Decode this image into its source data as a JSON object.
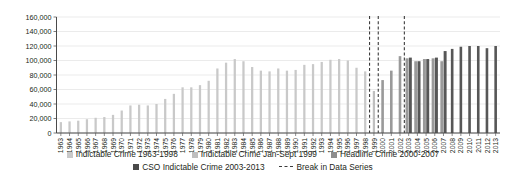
{
  "chart_data": {
    "type": "bar",
    "title": "",
    "subtitle": "",
    "xlabel": "",
    "ylabel": "",
    "ylim": [
      0,
      160000
    ],
    "ytick_step": 20000,
    "ytick_labels": [
      "0",
      "20,000",
      "40,000",
      "60,000",
      "80,000",
      "100,000",
      "120,000",
      "140,000",
      "160,000"
    ],
    "grid": true,
    "legend_position": "bottom",
    "categories": [
      "1963",
      "1964",
      "1965",
      "1966",
      "1967",
      "1968",
      "1969",
      "1970",
      "1971",
      "1972",
      "1973",
      "1974",
      "1975",
      "1976",
      "1977",
      "1978",
      "1979",
      "1980",
      "1981",
      "1982",
      "1983",
      "1984",
      "1985",
      "1986",
      "1987",
      "1988",
      "1989",
      "1990",
      "1991",
      "1992",
      "1993",
      "1994",
      "1995",
      "1996",
      "1997",
      "1998",
      "1999",
      "2000",
      "2001",
      "2002",
      "2003",
      "2004",
      "2005",
      "2006",
      "2007",
      "2008",
      "2009",
      "2010",
      "2011",
      "2012",
      "2013"
    ],
    "series": [
      {
        "name": "Indictable Crime 1963-1998",
        "color": "#c9c9c9",
        "values": [
          15000,
          16000,
          17000,
          19000,
          21000,
          22000,
          25000,
          31000,
          38000,
          39000,
          38000,
          40000,
          47000,
          54000,
          63000,
          63000,
          66000,
          72000,
          89000,
          97000,
          102000,
          99000,
          91000,
          86000,
          85000,
          89000,
          86000,
          87000,
          94000,
          95000,
          98000,
          101000,
          102000,
          100000,
          90000,
          85000,
          null,
          null,
          null,
          null,
          null,
          null,
          null,
          null,
          null,
          null,
          null,
          null,
          null,
          null,
          null
        ]
      },
      {
        "name": "Indictable Crime Jan-Sept 1999",
        "color": "#bfbfbf",
        "values": [
          null,
          null,
          null,
          null,
          null,
          null,
          null,
          null,
          null,
          null,
          null,
          null,
          null,
          null,
          null,
          null,
          null,
          null,
          null,
          null,
          null,
          null,
          null,
          null,
          null,
          null,
          null,
          null,
          null,
          null,
          null,
          null,
          null,
          null,
          null,
          null,
          58000,
          null,
          null,
          null,
          null,
          null,
          null,
          null,
          null,
          null,
          null,
          null,
          null,
          null,
          null
        ]
      },
      {
        "name": "Headline Crime 2000-2007",
        "color": "#9a9a9a",
        "values": [
          null,
          null,
          null,
          null,
          null,
          null,
          null,
          null,
          null,
          null,
          null,
          null,
          null,
          null,
          null,
          null,
          null,
          null,
          null,
          null,
          null,
          null,
          null,
          null,
          null,
          null,
          null,
          null,
          null,
          null,
          null,
          null,
          null,
          null,
          null,
          null,
          null,
          73000,
          86000,
          106000,
          103000,
          99000,
          102000,
          103000,
          99000,
          null,
          null,
          null,
          null,
          null,
          null
        ]
      },
      {
        "name": "CSO Indictable Crime 2003-2013",
        "color": "#575757",
        "values": [
          null,
          null,
          null,
          null,
          null,
          null,
          null,
          null,
          null,
          null,
          null,
          null,
          null,
          null,
          null,
          null,
          null,
          null,
          null,
          null,
          null,
          null,
          null,
          null,
          null,
          null,
          null,
          null,
          null,
          null,
          null,
          null,
          null,
          null,
          null,
          null,
          null,
          null,
          null,
          null,
          104000,
          99000,
          102000,
          104000,
          113000,
          116000,
          119000,
          120000,
          120000,
          117000,
          120000
        ]
      }
    ],
    "break_lines": {
      "label": "Break in Data Series",
      "color": "#3b3b3b",
      "at": [
        1998.5,
        1999.5,
        2002.5
      ]
    }
  },
  "legend": {
    "row1": [
      {
        "label": "Indictable Crime 1963-1998",
        "color": "#c9c9c9",
        "marker": "square"
      },
      {
        "label": "Indictable Crime Jan-Sept 1999",
        "color": "#bfbfbf",
        "marker": "square"
      },
      {
        "label": "Headline Crime 2000-2007",
        "color": "#8e8e8e",
        "marker": "square"
      }
    ],
    "row2": [
      {
        "label": "CSO Indictable Crime 2003-2013",
        "color": "#4a4a4a",
        "marker": "square"
      },
      {
        "label": "Break in Data Series",
        "color": "#3b3b3b",
        "marker": "dashed-line"
      }
    ]
  },
  "axis": {
    "y_tick_labels": [
      "160,000",
      "140,000",
      "120,000",
      "100,000",
      "80,000",
      "60,000",
      "40,000",
      "20,000",
      "0"
    ],
    "x_tick_labels": [
      "1963",
      "1964",
      "1965",
      "1966",
      "1967",
      "1968",
      "1969",
      "1970",
      "1971",
      "1972",
      "1973",
      "1974",
      "1975",
      "1976",
      "1977",
      "1978",
      "1979",
      "1980",
      "1981",
      "1982",
      "1983",
      "1984",
      "1985",
      "1986",
      "1987",
      "1988",
      "1989",
      "1990",
      "1991",
      "1992",
      "1993",
      "1994",
      "1995",
      "1996",
      "1997",
      "1998",
      "1999",
      "2000",
      "2001",
      "2002",
      "2003",
      "2004",
      "2005",
      "2006",
      "2007",
      "2008",
      "2009",
      "2010",
      "2011",
      "2012",
      "2013"
    ]
  }
}
